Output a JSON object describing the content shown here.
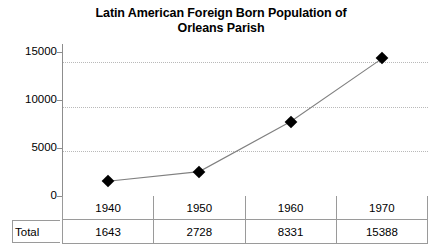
{
  "chart_data": {
    "type": "line",
    "title": "Latin American Foreign Born Population of Orleans Parish",
    "title_lines": [
      "Latin American Foreign Born Population of",
      "Orleans Parish"
    ],
    "xlabel": "",
    "ylabel": "",
    "categories": [
      "1940",
      "1950",
      "1960",
      "1970"
    ],
    "values": [
      1643,
      2728,
      8331,
      15388
    ],
    "series": [
      {
        "name": "Total",
        "values": [
          1643,
          2728,
          8331,
          15388
        ]
      }
    ],
    "ylim": [
      0,
      17000
    ],
    "ytick_labels": [
      "0",
      "5000",
      "10000",
      "15000"
    ],
    "ytick_values": [
      0,
      5000,
      10000,
      15000
    ],
    "grid": "horizontal-dotted",
    "legend": "none",
    "marker": "diamond",
    "marker_color": "#000000",
    "line_color": "#808080",
    "grid_color": "#b9b9b9",
    "axis_color": "#8d8d8d"
  },
  "table": {
    "row_label": "Total",
    "header": [
      "1940",
      "1950",
      "1960",
      "1970"
    ],
    "values": [
      "1643",
      "2728",
      "8331",
      "15388"
    ]
  }
}
